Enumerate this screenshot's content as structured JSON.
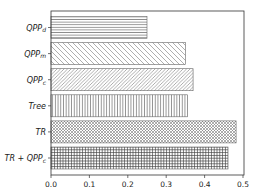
{
  "chart_data": {
    "type": "bar",
    "orientation": "horizontal",
    "title": "",
    "xlabel": "",
    "ylabel": "",
    "xlim": [
      0,
      0.503
    ],
    "grid": false,
    "legend": null,
    "categories": [
      "QPP_d",
      "QPP_m",
      "QPP_c",
      "Tree",
      "TR",
      "TR + QPP_c"
    ],
    "category_display": [
      {
        "base": "QPP",
        "sub": "d"
      },
      {
        "base": "QPP",
        "sub": "m"
      },
      {
        "base": "QPP",
        "sub": "c"
      },
      {
        "base": "Tree",
        "sub": ""
      },
      {
        "base": "TR",
        "sub": ""
      },
      {
        "base": "TR + QPP",
        "sub": "c"
      }
    ],
    "values": [
      0.25,
      0.35,
      0.37,
      0.355,
      0.482,
      0.461
    ],
    "hatches": [
      "---",
      "\\\\",
      "///",
      "||",
      "xx",
      "++"
    ],
    "xticks": [
      0.0,
      0.1,
      0.2,
      0.3,
      0.4,
      0.5
    ],
    "xtick_labels": [
      "0.0",
      "0.1",
      "0.2",
      "0.3",
      "0.4",
      "0.5"
    ],
    "colors": {
      "fill": "#ffffff",
      "hatch": "#555555",
      "edge": "#444444",
      "axis": "#333333"
    }
  }
}
